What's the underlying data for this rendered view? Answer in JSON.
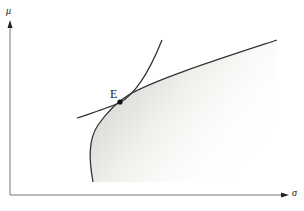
{
  "diagram": {
    "axes": {
      "y_label": "μ",
      "x_label": "σ"
    },
    "point": {
      "label": "E"
    },
    "colors": {
      "line": "#333333",
      "axis": "#666666",
      "shade_dark": "#c8c8c8",
      "shade_light": "#fbfbf4"
    }
  }
}
